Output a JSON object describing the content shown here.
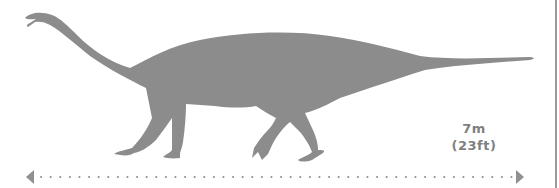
{
  "figure": {
    "silhouette_color": "#8c8c8c",
    "accent_color": "#8c8c8c",
    "border_color": "#9a9a9a"
  },
  "size": {
    "metric": "7m",
    "imperial": "(23ft)"
  },
  "scale_bar": {
    "style": "dotted-double-arrow",
    "color": "#909090"
  }
}
